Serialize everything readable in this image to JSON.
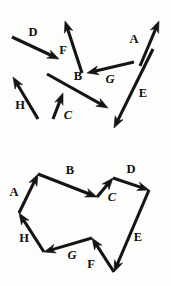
{
  "figure": {
    "background_color": "#fdfdfb",
    "stroke_color": "#141414",
    "label_color": "#101010",
    "panels": [
      {
        "name": "scattered-vectors",
        "caption": "",
        "vectors": [
          {
            "label": "A",
            "italic": false,
            "x1": 140,
            "y1": 66,
            "x2": 159,
            "y2": 21,
            "lx": 134,
            "ly": 40
          },
          {
            "label": "B",
            "italic": false,
            "x1": 47,
            "y1": 74,
            "x2": 108,
            "y2": 108,
            "lx": 78,
            "ly": 77
          },
          {
            "label": "C",
            "italic": true,
            "x1": 53,
            "y1": 119,
            "x2": 63,
            "y2": 93,
            "lx": 68,
            "ly": 116
          },
          {
            "label": "D",
            "italic": false,
            "x1": 12,
            "y1": 37,
            "x2": 59,
            "y2": 59,
            "lx": 33,
            "ly": 33
          },
          {
            "label": "E",
            "italic": false,
            "x1": 153,
            "y1": 49,
            "x2": 114,
            "y2": 128,
            "lx": 143,
            "ly": 94
          },
          {
            "label": "F",
            "italic": false,
            "x1": 82,
            "y1": 73,
            "x2": 65,
            "y2": 21,
            "lx": 63,
            "ly": 51
          },
          {
            "label": "G",
            "italic": true,
            "x1": 134,
            "y1": 62,
            "x2": 87,
            "y2": 73,
            "lx": 110,
            "ly": 80
          },
          {
            "label": "H",
            "italic": false,
            "x1": 38,
            "y1": 119,
            "x2": 13,
            "y2": 77,
            "lx": 20,
            "ly": 106
          }
        ]
      },
      {
        "name": "polygon-head-to-tail",
        "caption": "",
        "vectors": [
          {
            "label": "A",
            "italic": false,
            "x1": 19,
            "y1": 70,
            "x2": 38,
            "y2": 31,
            "lx": 14,
            "ly": 50
          },
          {
            "label": "B",
            "italic": false,
            "x1": 38,
            "y1": 31,
            "x2": 97,
            "y2": 54,
            "lx": 70,
            "ly": 28
          },
          {
            "label": "C",
            "italic": true,
            "x1": 97,
            "y1": 54,
            "x2": 113,
            "y2": 35,
            "lx": 112,
            "ly": 55
          },
          {
            "label": "D",
            "italic": false,
            "x1": 113,
            "y1": 35,
            "x2": 149,
            "y2": 47,
            "lx": 131,
            "ly": 27
          },
          {
            "label": "E",
            "italic": false,
            "x1": 149,
            "y1": 47,
            "x2": 114,
            "y2": 129,
            "lx": 138,
            "ly": 95
          },
          {
            "label": "F",
            "italic": false,
            "x1": 114,
            "y1": 129,
            "x2": 92,
            "y2": 95,
            "lx": 91,
            "ly": 122
          },
          {
            "label": "G",
            "italic": true,
            "x1": 92,
            "y1": 95,
            "x2": 44,
            "y2": 109,
            "lx": 72,
            "ly": 113
          },
          {
            "label": "H",
            "italic": false,
            "x1": 44,
            "y1": 109,
            "x2": 19,
            "y2": 70,
            "lx": 24,
            "ly": 96
          }
        ]
      }
    ]
  }
}
